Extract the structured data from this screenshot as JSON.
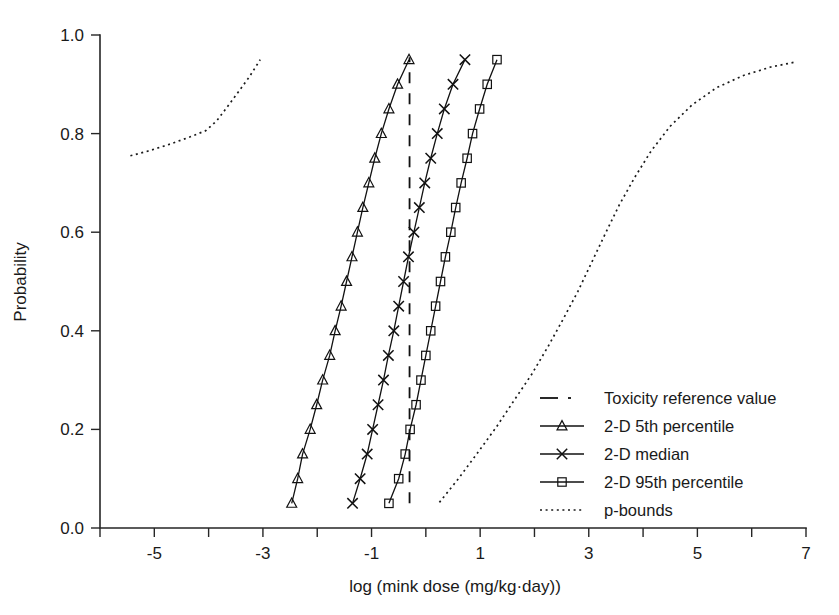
{
  "chart_data": {
    "type": "line",
    "title": "",
    "xlabel": "log (mink dose (mg/kg·day))",
    "ylabel": "Probability",
    "xlim": [
      -6,
      7
    ],
    "ylim": [
      0.0,
      1.0
    ],
    "xticks": [
      -6,
      -5,
      -4,
      -3,
      -2,
      -1,
      0,
      1,
      2,
      3,
      4,
      5,
      6,
      7
    ],
    "xticklabels": [
      "",
      "-5",
      "",
      "-3",
      "",
      "-1",
      "",
      "1",
      "",
      "3",
      "",
      "5",
      "",
      "7"
    ],
    "yticks": [
      0.0,
      0.2,
      0.4,
      0.6,
      0.8,
      1.0
    ],
    "yticklabels": [
      "0.0",
      "0.2",
      "0.4",
      "0.6",
      "0.8",
      "1.0"
    ],
    "grid": false,
    "legend_position": "right-middle",
    "series": [
      {
        "name": "Toxicity reference value",
        "marker": "none",
        "style": "dashed-vertical",
        "x_value": -0.3,
        "y_range": [
          0.05,
          0.955
        ]
      },
      {
        "name": "2-D 5th percentile",
        "marker": "triangle",
        "style": "solid",
        "points": [
          [
            -2.47,
            0.05
          ],
          [
            -2.36,
            0.1
          ],
          [
            -2.27,
            0.15
          ],
          [
            -2.13,
            0.2
          ],
          [
            -2.01,
            0.25
          ],
          [
            -1.9,
            0.3
          ],
          [
            -1.77,
            0.35
          ],
          [
            -1.67,
            0.4
          ],
          [
            -1.56,
            0.45
          ],
          [
            -1.46,
            0.5
          ],
          [
            -1.36,
            0.55
          ],
          [
            -1.26,
            0.6
          ],
          [
            -1.16,
            0.65
          ],
          [
            -1.05,
            0.7
          ],
          [
            -0.94,
            0.75
          ],
          [
            -0.82,
            0.8
          ],
          [
            -0.68,
            0.85
          ],
          [
            -0.52,
            0.9
          ],
          [
            -0.31,
            0.95
          ]
        ]
      },
      {
        "name": "2-D median",
        "marker": "x",
        "style": "solid",
        "points": [
          [
            -1.35,
            0.05
          ],
          [
            -1.21,
            0.1
          ],
          [
            -1.08,
            0.15
          ],
          [
            -0.98,
            0.2
          ],
          [
            -0.88,
            0.25
          ],
          [
            -0.78,
            0.3
          ],
          [
            -0.69,
            0.35
          ],
          [
            -0.59,
            0.4
          ],
          [
            -0.5,
            0.45
          ],
          [
            -0.41,
            0.5
          ],
          [
            -0.32,
            0.55
          ],
          [
            -0.22,
            0.6
          ],
          [
            -0.12,
            0.65
          ],
          [
            -0.02,
            0.7
          ],
          [
            0.09,
            0.75
          ],
          [
            0.21,
            0.8
          ],
          [
            0.34,
            0.85
          ],
          [
            0.5,
            0.9
          ],
          [
            0.72,
            0.95
          ]
        ]
      },
      {
        "name": "2-D 95th percentile",
        "marker": "square",
        "style": "solid",
        "points": [
          [
            -0.68,
            0.05
          ],
          [
            -0.5,
            0.1
          ],
          [
            -0.38,
            0.15
          ],
          [
            -0.29,
            0.2
          ],
          [
            -0.18,
            0.25
          ],
          [
            -0.09,
            0.3
          ],
          [
            0.0,
            0.35
          ],
          [
            0.09,
            0.4
          ],
          [
            0.18,
            0.45
          ],
          [
            0.27,
            0.5
          ],
          [
            0.36,
            0.55
          ],
          [
            0.46,
            0.6
          ],
          [
            0.55,
            0.65
          ],
          [
            0.65,
            0.7
          ],
          [
            0.76,
            0.75
          ],
          [
            0.86,
            0.8
          ],
          [
            0.99,
            0.85
          ],
          [
            1.13,
            0.9
          ],
          [
            1.31,
            0.95
          ]
        ]
      },
      {
        "name": "p-bounds",
        "marker": "none",
        "style": "dotted",
        "branches": [
          {
            "label": "left",
            "points": [
              [
                -5.44,
                0.755
              ],
              [
                -5.1,
                0.765
              ],
              [
                -4.7,
                0.779
              ],
              [
                -4.35,
                0.793
              ],
              [
                -4.05,
                0.806
              ],
              [
                -3.85,
                0.826
              ],
              [
                -3.65,
                0.855
              ],
              [
                -3.45,
                0.885
              ],
              [
                -3.25,
                0.915
              ],
              [
                -3.05,
                0.95
              ]
            ]
          },
          {
            "label": "right",
            "points": [
              [
                0.25,
                0.052
              ],
              [
                0.6,
                0.1
              ],
              [
                0.95,
                0.152
              ],
              [
                1.3,
                0.205
              ],
              [
                1.62,
                0.258
              ],
              [
                1.95,
                0.312
              ],
              [
                2.25,
                0.368
              ],
              [
                2.52,
                0.422
              ],
              [
                2.8,
                0.48
              ],
              [
                3.05,
                0.538
              ],
              [
                3.3,
                0.596
              ],
              [
                3.56,
                0.655
              ],
              [
                3.85,
                0.712
              ],
              [
                4.15,
                0.765
              ],
              [
                4.5,
                0.815
              ],
              [
                4.9,
                0.858
              ],
              [
                5.35,
                0.893
              ],
              [
                5.85,
                0.918
              ],
              [
                6.35,
                0.935
              ],
              [
                6.8,
                0.945
              ]
            ]
          }
        ]
      }
    ],
    "legend_entries": [
      {
        "label": "Toxicity reference value",
        "marker": "none",
        "style": "dashed"
      },
      {
        "label": "2-D 5th percentile",
        "marker": "triangle",
        "style": "solid"
      },
      {
        "label": "2-D median",
        "marker": "x",
        "style": "solid"
      },
      {
        "label": "2-D 95th percentile",
        "marker": "square",
        "style": "solid"
      },
      {
        "label": "p-bounds",
        "marker": "none",
        "style": "dotted"
      }
    ],
    "colors": {
      "ink": "#111111",
      "axis": "#262626",
      "background": "#ffffff"
    }
  }
}
